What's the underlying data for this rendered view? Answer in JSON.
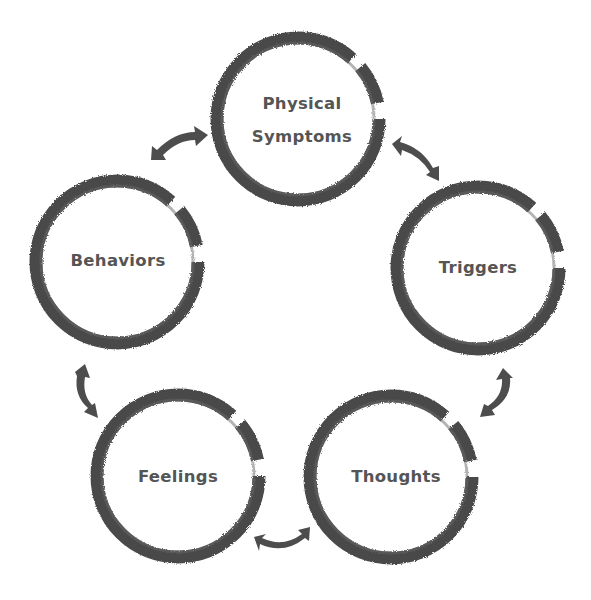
{
  "diagram": {
    "type": "cycle",
    "colors": {
      "stroke": "#4a4a4a",
      "text": "#555555",
      "arrow": "#4d4d4d",
      "background": "#ffffff"
    },
    "nodes": [
      {
        "id": "physical-symptoms",
        "line1": "Physical",
        "line2": "Symptoms",
        "cx": 298,
        "cy": 119,
        "r": 80
      },
      {
        "id": "triggers",
        "label": "Triggers",
        "cx": 478,
        "cy": 268,
        "r": 80
      },
      {
        "id": "thoughts",
        "label": "Thoughts",
        "cx": 391,
        "cy": 477,
        "r": 80
      },
      {
        "id": "feelings",
        "label": "Feelings",
        "cx": 178,
        "cy": 476,
        "r": 80
      },
      {
        "id": "behaviors",
        "label": "Behaviors",
        "cx": 117,
        "cy": 262,
        "r": 80
      }
    ],
    "connectors": [
      {
        "from": "physical-symptoms",
        "to": "triggers",
        "style": "double-arrow"
      },
      {
        "from": "triggers",
        "to": "thoughts",
        "style": "double-arrow"
      },
      {
        "from": "thoughts",
        "to": "feelings",
        "style": "double-arrow"
      },
      {
        "from": "feelings",
        "to": "behaviors",
        "style": "double-arrow"
      },
      {
        "from": "behaviors",
        "to": "physical-symptoms",
        "style": "double-arrow"
      }
    ]
  }
}
